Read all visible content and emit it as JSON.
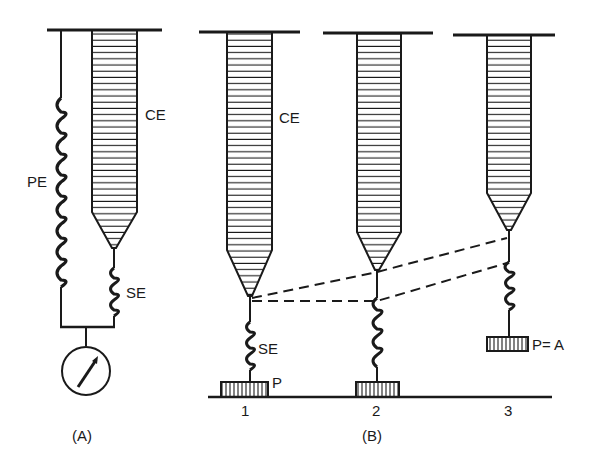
{
  "diagram": {
    "panel_a": {
      "caption": "(A)",
      "labels": {
        "contractile": "CE",
        "parallel": "PE",
        "series": "SE"
      }
    },
    "panel_b": {
      "caption": "(B)",
      "labels": {
        "contractile": "CE",
        "series": "SE",
        "load": "P",
        "load_equals": "P= A"
      },
      "stages": [
        {
          "number": "1"
        },
        {
          "number": "2"
        },
        {
          "number": "3"
        }
      ]
    },
    "colors": {
      "ink": "#1a1a1a",
      "background": "#ffffff"
    }
  }
}
